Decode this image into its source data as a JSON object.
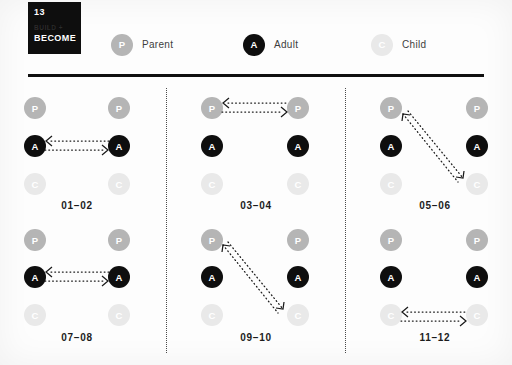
{
  "card": {
    "number": "13",
    "series": "BUILD +",
    "title": "BECOME"
  },
  "legend": [
    {
      "id": "parent",
      "letter": "P",
      "label": "Parent"
    },
    {
      "id": "adult",
      "letter": "A",
      "label": "Adult"
    },
    {
      "id": "child",
      "letter": "C",
      "label": "Child"
    }
  ],
  "roles": {
    "parent": "P",
    "adult": "A",
    "child": "C"
  },
  "panels": [
    {
      "label": "01–02",
      "transaction": "adult-to-adult",
      "direction": "bidirectional"
    },
    {
      "label": "03–04",
      "transaction": "parent-to-parent",
      "direction": "bidirectional"
    },
    {
      "label": "05–06",
      "transaction": "parent-to-child-diagonal",
      "direction": "bidirectional"
    },
    {
      "label": "07–08",
      "transaction": "adult-to-adult",
      "direction": "bidirectional"
    },
    {
      "label": "09–10",
      "transaction": "parent-to-child-diagonal",
      "direction": "bidirectional"
    },
    {
      "label": "11–12",
      "transaction": "child-to-child",
      "direction": "bidirectional"
    }
  ],
  "colors": {
    "parent": "#b5b5b5",
    "adult": "#0e0e0e",
    "child": "#e9e9e9",
    "arrow": "#1a1a1a",
    "rule": "#101010"
  }
}
